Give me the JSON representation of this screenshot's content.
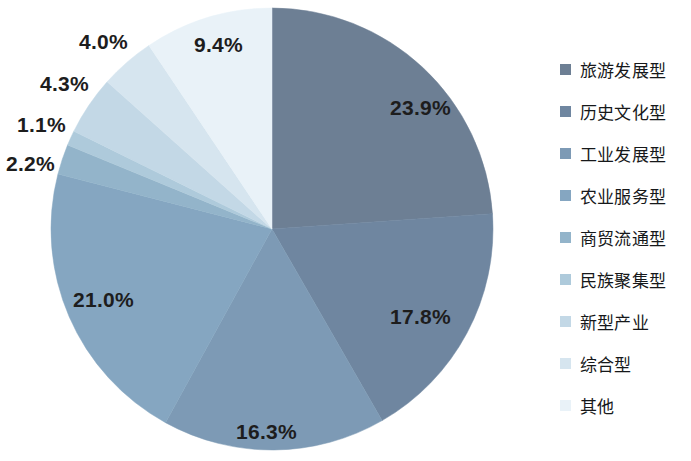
{
  "chart_data": {
    "type": "pie",
    "title": "",
    "subtitle": "",
    "xlabel": "",
    "ylabel": "",
    "legend_position": "right",
    "grid": false,
    "labels_format": "percent",
    "categories": [
      "旅游发展型",
      "历史文化型",
      "工业发展型",
      "农业服务型",
      "商贸流通型",
      "民族聚集型",
      "新型产业",
      "综合型",
      "其他"
    ],
    "values": [
      23.9,
      17.8,
      16.3,
      21.0,
      2.2,
      1.1,
      4.3,
      4.0,
      9.4
    ],
    "data_labels": [
      "23.9%",
      "17.8%",
      "16.3%",
      "21.0%",
      "2.2%",
      "1.1%",
      "4.3%",
      "4.0%",
      "9.4%"
    ],
    "colors": [
      "#6d7f94",
      "#6f86a0",
      "#7d9ab5",
      "#85a6c1",
      "#93b4ca",
      "#aecadb",
      "#c3d8e6",
      "#d6e5ef",
      "#e9f2f8"
    ],
    "start_angle_deg": 0,
    "direction": "clockwise",
    "total": 100.0
  },
  "pie": {
    "center_x": 272,
    "center_y": 229,
    "radius": 221,
    "slices": [
      {
        "name": "旅游发展型",
        "value": 23.9,
        "label": "23.9%",
        "color": "#6d7f94",
        "label_x": 390,
        "label_y": 96
      },
      {
        "name": "历史文化型",
        "value": 17.8,
        "label": "17.8%",
        "color": "#6f86a0",
        "label_x": 390,
        "label_y": 305
      },
      {
        "name": "工业发展型",
        "value": 16.3,
        "label": "16.3%",
        "color": "#7d9ab5",
        "label_x": 236,
        "label_y": 420
      },
      {
        "name": "农业服务型",
        "value": 21.0,
        "label": "21.0%",
        "color": "#85a6c1",
        "label_x": 73,
        "label_y": 288
      },
      {
        "name": "商贸流通型",
        "value": 2.2,
        "label": "2.2%",
        "color": "#93b4ca",
        "label_x": 6,
        "label_y": 152
      },
      {
        "name": "民族聚集型",
        "value": 1.1,
        "label": "1.1%",
        "color": "#aecadb",
        "label_x": 17,
        "label_y": 113
      },
      {
        "name": "新型产业",
        "value": 4.3,
        "label": "4.3%",
        "color": "#c3d8e6",
        "label_x": 40,
        "label_y": 72
      },
      {
        "name": "综合型",
        "value": 4.0,
        "label": "4.0%",
        "color": "#d6e5ef",
        "label_x": 79,
        "label_y": 30
      },
      {
        "name": "其他",
        "value": 9.4,
        "label": "9.4%",
        "color": "#e9f2f8",
        "label_x": 194,
        "label_y": 33
      }
    ]
  },
  "legend": {
    "items": [
      {
        "label": "旅游发展型",
        "color": "#6d7f94"
      },
      {
        "label": "历史文化型",
        "color": "#6f86a0"
      },
      {
        "label": "工业发展型",
        "color": "#7d9ab5"
      },
      {
        "label": "农业服务型",
        "color": "#85a6c1"
      },
      {
        "label": "商贸流通型",
        "color": "#93b4ca"
      },
      {
        "label": "民族聚集型",
        "color": "#aecadb"
      },
      {
        "label": "新型产业",
        "color": "#c3d8e6"
      },
      {
        "label": "综合型",
        "color": "#d6e5ef"
      },
      {
        "label": "其他",
        "color": "#e9f2f8"
      }
    ]
  }
}
